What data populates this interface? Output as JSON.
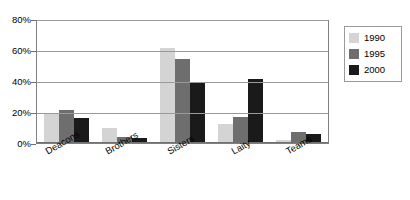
{
  "chart_data": {
    "type": "bar",
    "title": "",
    "subtitle": "",
    "xlabel": "",
    "ylabel": "",
    "categories": [
      "Deacons",
      "Brothers",
      "Sisters",
      "Laity",
      "Teams"
    ],
    "series": [
      {
        "name": "1990",
        "color": "#d4d4d4",
        "values": [
          19,
          10,
          61,
          12,
          2
        ]
      },
      {
        "name": "1995",
        "color": "#6e6e6e",
        "values": [
          21,
          4,
          54,
          17,
          7
        ]
      },
      {
        "name": "2000",
        "color": "#1a1a1a",
        "values": [
          16,
          3,
          39,
          41,
          6
        ]
      }
    ],
    "ylim": [
      0,
      80
    ],
    "y_ticks": [
      0,
      20,
      40,
      60,
      80
    ],
    "y_tick_labels": [
      "0%",
      "20%",
      "40%",
      "60%",
      "80%"
    ],
    "grid": true,
    "legend_position": "right",
    "annotations": []
  },
  "legend": {
    "entries": [
      {
        "label": "1990",
        "color": "#d4d4d4"
      },
      {
        "label": "1995",
        "color": "#6e6e6e"
      },
      {
        "label": "2000",
        "color": "#1a1a1a"
      }
    ]
  },
  "colors": {
    "background": "#ffffff",
    "frame": "#808080",
    "gridline": "#9a9a9a",
    "text": "#000000"
  }
}
